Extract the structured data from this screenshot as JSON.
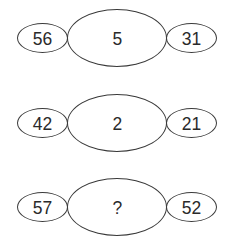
{
  "puzzle": {
    "rows": [
      {
        "left": "56",
        "center": "5",
        "right": "31"
      },
      {
        "left": "42",
        "center": "2",
        "right": "21"
      },
      {
        "left": "57",
        "center": "?",
        "right": "52"
      }
    ]
  },
  "colors": {
    "stroke": "#3a3a3a",
    "text": "#2a2a2a",
    "background": "#ffffff"
  }
}
